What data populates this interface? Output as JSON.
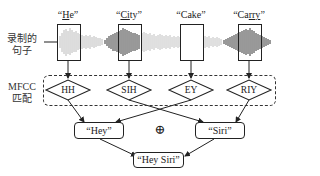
{
  "left_labels": {
    "recorded_sentence": [
      "录制的",
      "句子"
    ],
    "mfcc_match": [
      "MFCC",
      "匹配"
    ]
  },
  "words": [
    {
      "label_pre": "“",
      "label_u": "H",
      "label_post": "e”",
      "full": "“He”",
      "underlined": "H"
    },
    {
      "label_pre": "“",
      "label_u": "Ci",
      "label_post": "ty”",
      "full": "“City”",
      "underlined": "Ci"
    },
    {
      "label_pre": "“Cake”",
      "label_u": "",
      "label_post": "",
      "full": "“Cake”",
      "underlined": ""
    },
    {
      "label_pre": "“Ca",
      "label_u": "rry",
      "label_post": "”",
      "full": "“Carry”",
      "underlined": "rry"
    }
  ],
  "phonemes": [
    "HH",
    "SIH",
    "EY",
    "RIY"
  ],
  "partial_words": {
    "hey": "“Hey”",
    "siri": "“Siri”",
    "combine_symbol": "⊕"
  },
  "result": "“Hey Siri”",
  "colors": {
    "line": "#222222",
    "waveform_dark": "#333333",
    "waveform_light": "#9a9a9a",
    "background": "#ffffff"
  }
}
